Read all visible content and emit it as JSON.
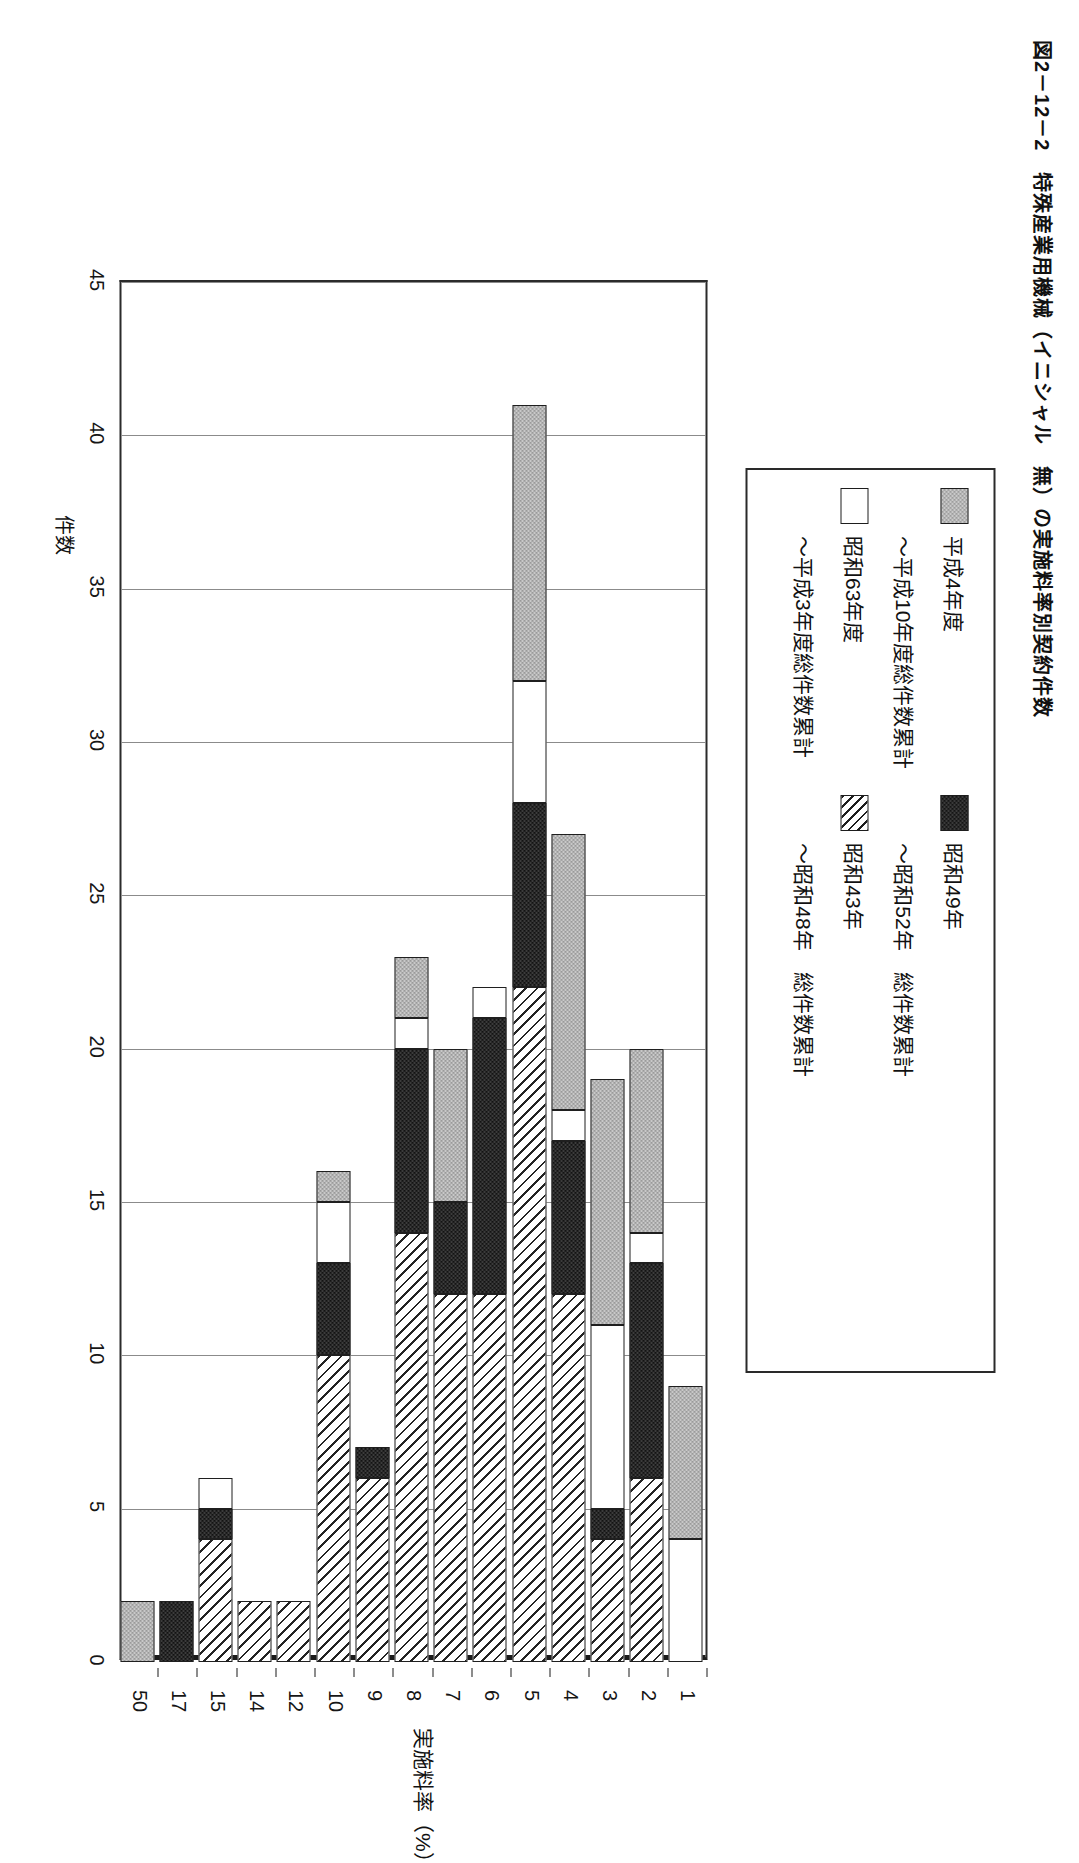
{
  "figure": {
    "title": "図2－12－2　特殊産業用機械（イニシャル　無）の実施料率別契約件数"
  },
  "legend": {
    "items": [
      {
        "label": "平成4年度",
        "pattern": "grey-dotted"
      },
      {
        "label": "～平成10年度総件数累計",
        "pattern": "grey-dotted"
      },
      {
        "label": "昭和63年度",
        "pattern": "white"
      },
      {
        "label": "～平成3年度総件数累計",
        "pattern": "white"
      },
      {
        "label": "昭和49年",
        "pattern": "dark-dotted"
      },
      {
        "label": "～昭和52年　総件数累計",
        "pattern": "dark-dotted"
      },
      {
        "label": "昭和43年",
        "pattern": "diagonal-hatch"
      },
      {
        "label": "～昭和48年　総件数累計",
        "pattern": "diagonal-hatch"
      }
    ]
  },
  "chart_data": {
    "type": "bar",
    "orientation": "horizontal-printed-rotated",
    "title": "図2－12－2　特殊産業用機械（イニシャル　無）の実施料率別契約件数",
    "xlabel": "実施料率（%）",
    "ylabel": "件数",
    "ylim": [
      0,
      45
    ],
    "yticks": [
      0,
      5,
      10,
      15,
      20,
      25,
      30,
      35,
      40,
      45
    ],
    "grid": true,
    "legend_position": "top",
    "stacked": true,
    "categories": [
      "1",
      "2",
      "3",
      "4",
      "5",
      "6",
      "7",
      "8",
      "9",
      "10",
      "12",
      "14",
      "15",
      "17",
      "50"
    ],
    "series": [
      {
        "name": "昭和43年～昭和48年　総件数累計",
        "key": "s1",
        "pattern": "diagonal-hatch",
        "values": [
          0,
          6,
          4,
          12,
          22,
          12,
          12,
          14,
          6,
          10,
          2,
          2,
          4,
          0,
          0
        ]
      },
      {
        "name": "昭和49年～昭和52年　総件数累計",
        "key": "s2",
        "pattern": "dark-dotted",
        "values": [
          0,
          7,
          1,
          5,
          6,
          9,
          3,
          6,
          1,
          3,
          0,
          0,
          1,
          2,
          0
        ]
      },
      {
        "name": "昭和63年度～平成3年度総件数累計",
        "key": "s3",
        "pattern": "white",
        "values": [
          4,
          1,
          6,
          1,
          4,
          1,
          0,
          1,
          0,
          2,
          0,
          0,
          1,
          0,
          0
        ]
      },
      {
        "name": "平成4年度～平成10年度総件数累計",
        "key": "s4",
        "pattern": "grey-dotted",
        "values": [
          5,
          6,
          8,
          9,
          9,
          0,
          5,
          2,
          0,
          1,
          0,
          0,
          0,
          0,
          2
        ]
      }
    ],
    "totals": [
      9,
      20,
      19,
      27,
      41,
      22,
      20,
      23,
      7,
      16,
      2,
      2,
      6,
      2,
      2
    ]
  }
}
